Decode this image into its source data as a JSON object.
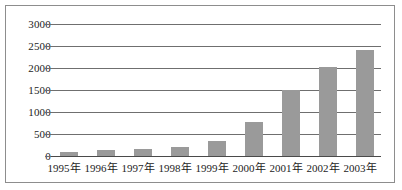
{
  "chart_data": {
    "type": "bar",
    "title": "",
    "subtitle": "",
    "xlabel": "",
    "ylabel": "",
    "categories": [
      "1995年",
      "1996年",
      "1997年",
      "1998年",
      "1999年",
      "2000年",
      "2001年",
      "2002年",
      "2003年"
    ],
    "values": [
      100,
      130,
      150,
      200,
      350,
      770,
      1500,
      2020,
      2400
    ],
    "series": [
      {
        "name": "",
        "values": [
          100,
          130,
          150,
          200,
          350,
          770,
          1500,
          2020,
          2400
        ]
      }
    ],
    "ylim": [
      0,
      3000
    ],
    "ytick_labels": [
      "0",
      "500",
      "1000",
      "1500",
      "2000",
      "2500",
      "3000"
    ],
    "ytick_values": [
      0,
      500,
      1000,
      1500,
      2000,
      2500,
      3000
    ],
    "grid": true,
    "legend": false,
    "legend_position": "none",
    "bar_color": "#9a9a9a",
    "gridline_color": "#6f6f6f",
    "axis_color": "#4a4a4a",
    "frame_color": "#8d8d8d",
    "background_color": "#ffffff",
    "annotations": []
  }
}
